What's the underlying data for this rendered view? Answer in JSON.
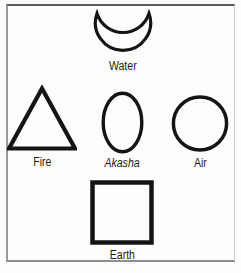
{
  "diagram": {
    "symbols": [
      {
        "label": "Water",
        "shape": "crescent"
      },
      {
        "label": "Fire",
        "shape": "triangle"
      },
      {
        "label": "Akasha",
        "shape": "oval"
      },
      {
        "label": "Air",
        "shape": "circle"
      },
      {
        "label": "Earth",
        "shape": "square"
      }
    ],
    "colors": {
      "shape_stroke": "#141414",
      "label_text": "#1c1c1c",
      "frame_dark": "#5a5a5a",
      "frame_light": "#c8c8c8",
      "background": "#fdfdfc"
    }
  }
}
